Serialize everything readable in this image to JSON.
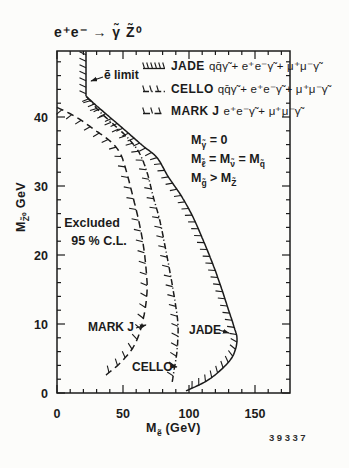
{
  "figure": {
    "title": "e⁺e⁻ → γ̃  Z̃⁰",
    "number": "39337"
  },
  "colors": {
    "ink": "#1b1b1b",
    "paper": "#fcfcfa"
  },
  "legend": {
    "entries": [
      {
        "name": "JADE",
        "line_style": "solid",
        "formula": "qq̄γ̃ + e⁺e⁻γ̃ + μ⁺μ⁻γ̃"
      },
      {
        "name": "CELLO",
        "line_style": "dashdot",
        "formula": "qq̄γ̃ + e⁺e⁻γ̃ + μ⁺μ⁻γ̃"
      },
      {
        "name": "MARK J",
        "line_style": "dashed",
        "formula": "e⁺e⁻γ̃ + μ⁺μ⁻γ̃"
      }
    ]
  },
  "assumptions": {
    "lines": [
      {
        "tokens": [
          {
            "t": "M",
            "sub": "γ̃"
          },
          {
            "t": " = 0"
          }
        ]
      },
      {
        "tokens": [
          {
            "t": "M",
            "sub": "ℓ̃"
          },
          {
            "t": " = M",
            "sub": "ν̃"
          },
          {
            "t": " = M",
            "sub": "q̃"
          }
        ]
      },
      {
        "tokens": [
          {
            "t": "M",
            "sub": "g̃"
          },
          {
            "t": " > M",
            "sub": "Z̃"
          }
        ]
      }
    ]
  },
  "plot_labels": {
    "excluded_line1": "Excluded",
    "excluded_line2": "95 % C.L.",
    "selectron_limit": "ẽ limit",
    "jade": "JADE",
    "cello": "CELLO",
    "markj": "MARK J"
  },
  "axes": {
    "x": {
      "label_tokens": [
        {
          "t": "M",
          "sub": "ẽ"
        },
        {
          "t": " (GeV)"
        }
      ],
      "major_ticks": [
        0,
        50,
        100,
        150
      ],
      "minor_step": 10,
      "range": [
        0,
        176
      ]
    },
    "y": {
      "label_tokens": [
        {
          "t": "M",
          "sub": "Z̃⁰"
        },
        {
          "t": " GeV"
        }
      ],
      "major_ticks": [
        0,
        10,
        20,
        30,
        40
      ],
      "minor_step": 2,
      "range": [
        0,
        49.5
      ]
    }
  },
  "chart_data": {
    "type": "line",
    "xlabel": "M_selectron (GeV)",
    "ylabel": "M_Zino (GeV)",
    "xlim": [
      0,
      176
    ],
    "ylim": [
      0,
      49.5
    ],
    "grid": false,
    "legend_position": "top-right-inside",
    "excluded_region": "left of curves, hatched side",
    "series": [
      {
        "name": "e~ limit",
        "line_style": "solid",
        "points": [
          [
            22,
            49.5
          ],
          [
            22,
            43
          ]
        ]
      },
      {
        "name": "JADE",
        "line_style": "solid",
        "points": [
          [
            22,
            43
          ],
          [
            29.5,
            41.7
          ],
          [
            41.7,
            39.7
          ],
          [
            53.8,
            37.7
          ],
          [
            65.2,
            35.8
          ],
          [
            75.8,
            34.1
          ],
          [
            84.1,
            31.4
          ],
          [
            94.7,
            28.4
          ],
          [
            103,
            25.5
          ],
          [
            110.6,
            22.2
          ],
          [
            117.4,
            19
          ],
          [
            123.5,
            15.8
          ],
          [
            129.5,
            12.3
          ],
          [
            134.1,
            9.6
          ],
          [
            136.4,
            7.7
          ],
          [
            133.3,
            5.4
          ],
          [
            125,
            3.5
          ],
          [
            112.9,
            1.7
          ],
          [
            97.7,
            0.3
          ]
        ]
      },
      {
        "name": "CELLO",
        "line_style": "dashdot",
        "points": [
          [
            22.7,
            42.9
          ],
          [
            31.8,
            40.9
          ],
          [
            42.4,
            39
          ],
          [
            53,
            37.1
          ],
          [
            62.1,
            34.9
          ],
          [
            68.2,
            32
          ],
          [
            72.7,
            28.6
          ],
          [
            78,
            24.9
          ],
          [
            81.8,
            21.3
          ],
          [
            85.6,
            17.5
          ],
          [
            89.4,
            13.3
          ],
          [
            91.7,
            9.7
          ],
          [
            90.9,
            6.1
          ],
          [
            88.6,
            3.2
          ],
          [
            87.1,
            1.4
          ]
        ]
      },
      {
        "name": "MARK J",
        "line_style": "dashed",
        "points": [
          [
            0,
            41.4
          ],
          [
            14.4,
            40
          ],
          [
            28.8,
            38.1
          ],
          [
            40.2,
            36.5
          ],
          [
            47.7,
            34.8
          ],
          [
            52.3,
            32.3
          ],
          [
            56.8,
            29
          ],
          [
            61.4,
            25.4
          ],
          [
            65.2,
            21.7
          ],
          [
            67.4,
            18.1
          ],
          [
            68.2,
            14.6
          ],
          [
            65.2,
            10.6
          ],
          [
            59.1,
            7.1
          ],
          [
            49.2,
            4.6
          ],
          [
            37.1,
            2.6
          ]
        ]
      }
    ]
  }
}
